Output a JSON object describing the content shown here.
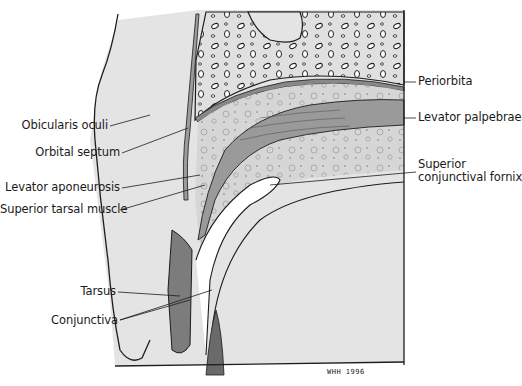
{
  "figure": {
    "signature": "WHH 1996",
    "colors": {
      "background": "#ffffff",
      "tissue_light": "#e3e3e3",
      "bone": "#dcdcdc",
      "fat": "#d2d2d2",
      "muscle": "#9a9a9a",
      "tarsus": "#7c7c7c",
      "outline": "#1c1c1c"
    }
  },
  "labels_left": [
    {
      "id": "obicularis-oculi",
      "text": "Obicularis oculi"
    },
    {
      "id": "orbital-septum",
      "text": "Orbital septum"
    },
    {
      "id": "levator-aponeurosis",
      "text": "Levator aponeurosis"
    },
    {
      "id": "superior-tarsal-muscle",
      "text": "Superior tarsal muscle"
    },
    {
      "id": "tarsus",
      "text": "Tarsus"
    },
    {
      "id": "conjunctiva",
      "text": "Conjunctiva"
    }
  ],
  "labels_right": [
    {
      "id": "periorbita",
      "text": "Periorbita"
    },
    {
      "id": "levator-palpebrae",
      "text": "Levator palpebrae"
    },
    {
      "id": "superior-conjunctival-fornix-1",
      "text": "Superior"
    },
    {
      "id": "superior-conjunctival-fornix-2",
      "text": "conjunctival fornix"
    }
  ]
}
